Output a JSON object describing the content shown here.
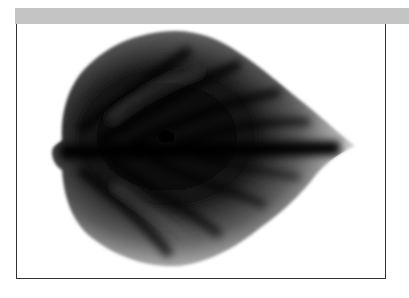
{
  "figure": {
    "rendering": "grayscale",
    "colors": {
      "header_bar": "#c4c4c4",
      "frame_border": "#333333",
      "background": "#ffffff",
      "leaf_dark": "#050505",
      "leaf_edge": "#d8d8d8"
    }
  }
}
